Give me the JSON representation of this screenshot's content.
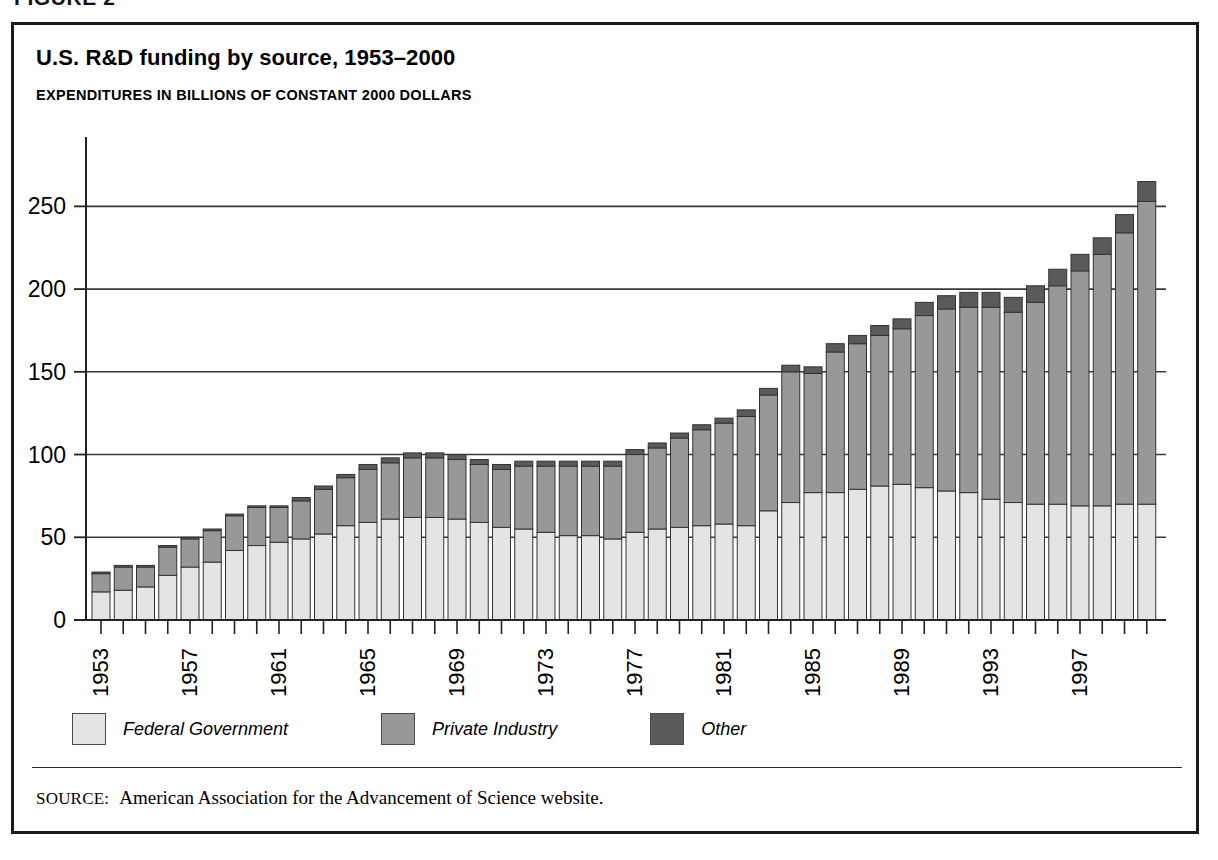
{
  "figure": {
    "label": "FIGURE 2"
  },
  "chart_title": "U.S. R&D funding by source, 1953–2000",
  "chart_subtitle": "EXPENDITURES IN BILLIONS OF CONSTANT 2000 DOLLARS",
  "source": {
    "kicker": "SOURCE:",
    "text": "American Association for the Advancement of Science website."
  },
  "colors": {
    "federal": "#e4e4e4",
    "private": "#989898",
    "other": "#5a5a5a",
    "bar_outline": "#333333",
    "axis": "#222222",
    "grid": "#3a3a3a",
    "frame": "#1a1a1a",
    "background": "#ffffff"
  },
  "legend": {
    "items": [
      {
        "label": "Federal Government",
        "color_key": "federal",
        "swatch": "#e4e4e4"
      },
      {
        "label": "Private Industry",
        "color_key": "private",
        "swatch": "#989898"
      },
      {
        "label": "Other",
        "color_key": "other",
        "swatch": "#5a5a5a"
      }
    ]
  },
  "chart_data": {
    "type": "bar",
    "subtype": "stacked-vertical",
    "title": "U.S. R&D funding by source, 1953–2000",
    "subtitle": "EXPENDITURES IN BILLIONS OF CONSTANT 2000 DOLLARS",
    "xlabel": "",
    "ylabel": "",
    "ylim": [
      0,
      275
    ],
    "yticks": [
      0,
      50,
      100,
      150,
      200,
      250
    ],
    "ytick_labels": [
      "0",
      "50",
      "100",
      "150",
      "200",
      "250"
    ],
    "grid": true,
    "grid_axis": "y",
    "legend_position": "bottom-left",
    "x": [
      1953,
      1954,
      1955,
      1956,
      1957,
      1958,
      1959,
      1960,
      1961,
      1962,
      1963,
      1964,
      1965,
      1966,
      1967,
      1968,
      1969,
      1970,
      1971,
      1972,
      1973,
      1974,
      1975,
      1976,
      1977,
      1978,
      1979,
      1980,
      1981,
      1982,
      1983,
      1984,
      1985,
      1986,
      1987,
      1988,
      1989,
      1990,
      1991,
      1992,
      1993,
      1994,
      1995,
      1996,
      1997,
      1998,
      1999,
      2000
    ],
    "xtick_labels_shown": [
      "1953",
      "1957",
      "1961",
      "1965",
      "1969",
      "1973",
      "1977",
      "1981",
      "1985",
      "1989",
      "1993",
      "1997"
    ],
    "xtick_interval_years": 4,
    "categories": [
      "1953",
      "1954",
      "1955",
      "1956",
      "1957",
      "1958",
      "1959",
      "1960",
      "1961",
      "1962",
      "1963",
      "1964",
      "1965",
      "1966",
      "1967",
      "1968",
      "1969",
      "1970",
      "1971",
      "1972",
      "1973",
      "1974",
      "1975",
      "1976",
      "1977",
      "1978",
      "1979",
      "1980",
      "1981",
      "1982",
      "1983",
      "1984",
      "1985",
      "1986",
      "1987",
      "1988",
      "1989",
      "1990",
      "1991",
      "1992",
      "1993",
      "1994",
      "1995",
      "1996",
      "1997",
      "1998",
      "1999",
      "2000"
    ],
    "series": [
      {
        "name": "Federal Government",
        "color": "#e4e4e4",
        "values": [
          17,
          18,
          20,
          27,
          32,
          35,
          42,
          45,
          47,
          49,
          52,
          57,
          59,
          61,
          62,
          62,
          61,
          59,
          56,
          55,
          53,
          51,
          51,
          49,
          53,
          55,
          56,
          57,
          58,
          57,
          66,
          71,
          77,
          77,
          79,
          81,
          82,
          80,
          78,
          77,
          73,
          71,
          70,
          70,
          69,
          69,
          70,
          70
        ]
      },
      {
        "name": "Private Industry",
        "color": "#989898",
        "values": [
          11,
          14,
          12,
          17,
          17,
          19,
          21,
          23,
          21,
          23,
          27,
          29,
          32,
          34,
          36,
          36,
          36,
          35,
          35,
          38,
          40,
          42,
          42,
          44,
          47,
          49,
          54,
          58,
          61,
          66,
          70,
          79,
          72,
          85,
          88,
          91,
          94,
          104,
          110,
          112,
          116,
          115,
          122,
          132,
          142,
          152,
          164,
          183
        ]
      },
      {
        "name": "Other",
        "color": "#5a5a5a",
        "values": [
          1,
          1,
          1,
          1,
          1,
          1,
          1,
          1,
          1,
          2,
          2,
          2,
          3,
          3,
          3,
          3,
          3,
          3,
          3,
          3,
          3,
          3,
          3,
          3,
          3,
          3,
          3,
          3,
          3,
          4,
          4,
          4,
          4,
          5,
          5,
          6,
          6,
          8,
          8,
          9,
          9,
          9,
          10,
          10,
          10,
          10,
          11,
          12
        ]
      }
    ],
    "totals": [
      29,
      33,
      33,
      45,
      50,
      55,
      64,
      69,
      69,
      74,
      81,
      88,
      94,
      98,
      101,
      101,
      100,
      97,
      94,
      96,
      96,
      96,
      96,
      96,
      103,
      107,
      113,
      118,
      122,
      127,
      140,
      154,
      153,
      167,
      172,
      178,
      182,
      192,
      196,
      198,
      198,
      195,
      202,
      212,
      221,
      231,
      245,
      265
    ]
  },
  "geometry": {
    "plot_left": 72,
    "plot_right": 1140,
    "plot_top": 140,
    "plot_bottom": 595,
    "y_max": 275,
    "bar_pitch": 22.25,
    "bar_width": 18
  }
}
